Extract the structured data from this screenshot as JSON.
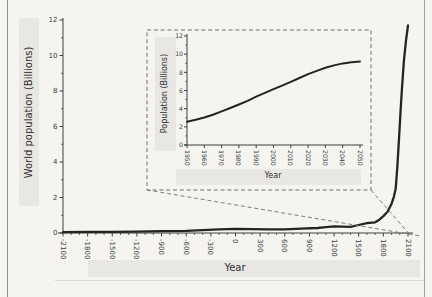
{
  "figure": {
    "background_color": "#f5f4f1",
    "highlight_band_color": "#e8e7e3",
    "page_border_left_color": "#8f8f8f",
    "page_border_right_color": "#a5a29d"
  },
  "chart_data": [
    {
      "id": "main",
      "type": "line",
      "title": "",
      "xlabel": "Year",
      "ylabel": "World population (Billions)",
      "xlim": [
        -2100,
        2100
      ],
      "ylim": [
        0,
        12
      ],
      "xticks": [
        -2100,
        -1800,
        -1500,
        -1200,
        -900,
        -600,
        -300,
        0,
        300,
        600,
        900,
        1200,
        1500,
        1800,
        2100
      ],
      "xtick_minor_step": 100,
      "yticks": [
        0,
        2,
        4,
        6,
        8,
        10,
        12
      ],
      "ytick_minor_step": 1,
      "grid": false,
      "line_color": "#242424",
      "line_width": 2.3,
      "x": [
        -2100,
        -1800,
        -1500,
        -1200,
        -900,
        -600,
        -400,
        -200,
        0,
        200,
        400,
        600,
        800,
        1000,
        1100,
        1200,
        1300,
        1400,
        1500,
        1600,
        1700,
        1750,
        1800,
        1850,
        1900,
        1930,
        1950,
        1970,
        1990,
        2000,
        2010,
        2025,
        2050,
        2075,
        2100
      ],
      "y": [
        0.05,
        0.06,
        0.07,
        0.08,
        0.1,
        0.12,
        0.16,
        0.2,
        0.23,
        0.22,
        0.2,
        0.21,
        0.24,
        0.28,
        0.33,
        0.37,
        0.36,
        0.35,
        0.45,
        0.55,
        0.6,
        0.75,
        0.95,
        1.2,
        1.65,
        2.07,
        2.5,
        3.7,
        5.3,
        6.1,
        6.9,
        8.0,
        9.7,
        10.8,
        11.7
      ]
    },
    {
      "id": "inset",
      "type": "line",
      "title": "",
      "xlabel": "Year",
      "ylabel": "Population (Billions)",
      "xlim": [
        1950,
        2050
      ],
      "ylim": [
        0,
        12
      ],
      "xticks": [
        1950,
        1960,
        1970,
        1980,
        1990,
        2000,
        2010,
        2020,
        2030,
        2040,
        2050
      ],
      "yticks": [
        0,
        2,
        4,
        6,
        8,
        10,
        12
      ],
      "ytick_minor_step": 1,
      "grid": false,
      "line_color": "#242424",
      "line_width": 2.0,
      "x": [
        1950,
        1955,
        1960,
        1965,
        1970,
        1975,
        1980,
        1985,
        1990,
        1995,
        2000,
        2005,
        2010,
        2015,
        2020,
        2025,
        2030,
        2035,
        2040,
        2045,
        2050
      ],
      "y": [
        2.55,
        2.77,
        3.03,
        3.34,
        3.7,
        4.07,
        4.46,
        4.87,
        5.33,
        5.74,
        6.14,
        6.54,
        6.96,
        7.38,
        7.8,
        8.16,
        8.5,
        8.76,
        8.98,
        9.12,
        9.2
      ]
    }
  ],
  "zoom_indicator": {
    "style": "dashed",
    "color": "#6e6e6e",
    "box_region_years": "1950-2050"
  }
}
